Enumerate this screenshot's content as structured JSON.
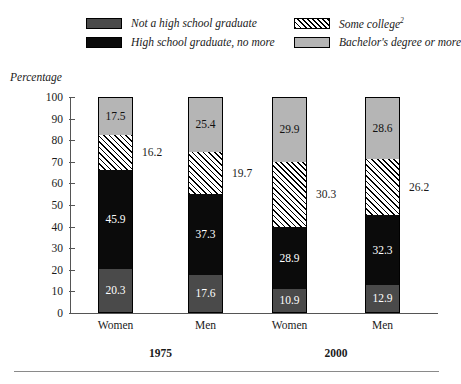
{
  "axis_title": "Percentage",
  "legend": {
    "items": [
      {
        "label": "Not a high school graduate",
        "swatch": "darkgray",
        "icon": "legend-swatch-dark-gray"
      },
      {
        "label": "High school graduate, no more",
        "swatch": "black",
        "icon": "legend-swatch-black"
      },
      {
        "label": "Some college",
        "superscript": "2",
        "swatch": "hatch",
        "icon": "legend-swatch-hatched"
      },
      {
        "label": "Bachelor's degree or more",
        "swatch": "lightgray",
        "icon": "legend-swatch-light-gray"
      }
    ]
  },
  "y_axis": {
    "ticks": [
      "100",
      "90",
      "80",
      "70",
      "60",
      "50",
      "40",
      "30",
      "20",
      "10",
      "0"
    ]
  },
  "x_axis": {
    "categories": [
      "Women",
      "Men",
      "Women",
      "Men"
    ],
    "groups": [
      "1975",
      "2000"
    ]
  },
  "colors": {
    "not_high_school": "#4a4a4a",
    "high_school": "#0b0b0b",
    "some_college": "#ffffff",
    "bachelors": "#b5b5b5",
    "axis": "#555555",
    "text": "#1a1a1a"
  },
  "chart_data": {
    "type": "bar",
    "subtype": "stacked-vertical-100pct",
    "title": "",
    "xlabel": "",
    "ylabel": "Percentage",
    "ylim": [
      0,
      100
    ],
    "ytick_step": 10,
    "grid": false,
    "legend_position": "top",
    "categories": [
      "Women 1975",
      "Men 1975",
      "Women 2000",
      "Men 2000"
    ],
    "groups": [
      {
        "label": "1975",
        "categories": [
          "Women",
          "Men"
        ]
      },
      {
        "label": "2000",
        "categories": [
          "Women",
          "Men"
        ]
      }
    ],
    "series": [
      {
        "name": "Not a high school graduate",
        "fill": "darkgray",
        "values": [
          20.3,
          17.6,
          10.9,
          12.9
        ]
      },
      {
        "name": "High school graduate, no more",
        "fill": "black",
        "values": [
          45.9,
          37.3,
          28.9,
          32.3
        ]
      },
      {
        "name": "Some college",
        "fill": "hatch",
        "values": [
          16.2,
          19.7,
          30.3,
          26.2
        ]
      },
      {
        "name": "Bachelor's degree or more",
        "fill": "lightgray",
        "values": [
          17.5,
          25.4,
          29.9,
          28.6
        ]
      }
    ],
    "data_labels": {
      "inside": [
        "20.3",
        "45.9",
        "17.5",
        "17.6",
        "37.3",
        "25.4",
        "10.9",
        "28.9",
        "29.9",
        "12.9",
        "32.3",
        "28.6"
      ],
      "outside": [
        "16.2",
        "19.7",
        "30.3",
        "26.2"
      ]
    }
  },
  "bars": [
    {
      "name": "Women 1975",
      "x": 28,
      "segments": [
        {
          "series": "Bachelor's degree or more",
          "fill": "lightgray",
          "value": 17.5,
          "label": "17.5",
          "label_position": "inside"
        },
        {
          "series": "Some college",
          "fill": "hatch",
          "value": 16.2,
          "label": "16.2",
          "label_position": "outside"
        },
        {
          "series": "High school graduate, no more",
          "fill": "black",
          "value": 45.9,
          "label": "45.9",
          "label_position": "inside"
        },
        {
          "series": "Not a high school graduate",
          "fill": "darkgray",
          "value": 20.3,
          "label": "20.3",
          "label_position": "inside"
        }
      ]
    },
    {
      "name": "Men 1975",
      "x": 118,
      "segments": [
        {
          "series": "Bachelor's degree or more",
          "fill": "lightgray",
          "value": 25.4,
          "label": "25.4",
          "label_position": "inside"
        },
        {
          "series": "Some college",
          "fill": "hatch",
          "value": 19.7,
          "label": "19.7",
          "label_position": "outside"
        },
        {
          "series": "High school graduate, no more",
          "fill": "black",
          "value": 37.3,
          "label": "37.3",
          "label_position": "inside"
        },
        {
          "series": "Not a high school graduate",
          "fill": "darkgray",
          "value": 17.6,
          "label": "17.6",
          "label_position": "inside"
        }
      ]
    },
    {
      "name": "Women 2000",
      "x": 202,
      "segments": [
        {
          "series": "Bachelor's degree or more",
          "fill": "lightgray",
          "value": 29.9,
          "label": "29.9",
          "label_position": "inside"
        },
        {
          "series": "Some college",
          "fill": "hatch",
          "value": 30.3,
          "label": "30.3",
          "label_position": "outside"
        },
        {
          "series": "High school graduate, no more",
          "fill": "black",
          "value": 28.9,
          "label": "28.9",
          "label_position": "inside"
        },
        {
          "series": "Not a high school graduate",
          "fill": "darkgray",
          "value": 10.9,
          "label": "10.9",
          "label_position": "inside"
        }
      ]
    },
    {
      "name": "Men 2000",
      "x": 295,
      "segments": [
        {
          "series": "Bachelor's degree or more",
          "fill": "lightgray",
          "value": 28.6,
          "label": "28.6",
          "label_position": "inside"
        },
        {
          "series": "Some college",
          "fill": "hatch",
          "value": 26.2,
          "label": "26.2",
          "label_position": "outside"
        },
        {
          "series": "High school graduate, no more",
          "fill": "black",
          "value": 32.3,
          "label": "32.3",
          "label_position": "inside"
        },
        {
          "series": "Not a high school graduate",
          "fill": "darkgray",
          "value": 12.9,
          "label": "12.9",
          "label_position": "inside"
        }
      ]
    }
  ]
}
